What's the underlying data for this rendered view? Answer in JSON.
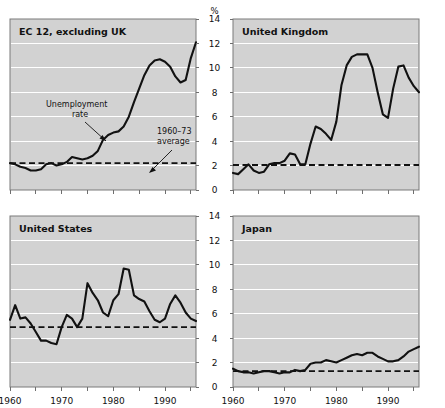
{
  "figure": {
    "unit_label": "%",
    "x_axis": {
      "min": 1960,
      "max": 1996,
      "tick_labels": [
        "1960",
        "1970",
        "1980",
        "1990"
      ],
      "tick_values": [
        1960,
        1970,
        1980,
        1990
      ],
      "minor_tick_values": [
        1965,
        1975,
        1985,
        1995
      ]
    },
    "y_axis": {
      "min": 0,
      "max": 14,
      "tick_labels": [
        "0",
        "2",
        "4",
        "6",
        "8",
        "10",
        "12",
        "14"
      ],
      "tick_values": [
        0,
        2,
        4,
        6,
        8,
        10,
        12,
        14
      ]
    },
    "colors": {
      "plot_background": "#d2d2d2",
      "gridline": "#ffffff",
      "series": "#111111",
      "average_line": "#111111",
      "axis": "#6e6e6e",
      "page_background": "#ffffff"
    }
  },
  "annotations": {
    "unemployment_rate": {
      "line1": "Unemployment",
      "line2": "rate"
    },
    "average_1960_73": {
      "line1": "1960–73",
      "line2": "average"
    }
  },
  "chart_data": [
    {
      "type": "line",
      "title": "EC 12, excluding UK",
      "panel": "top-left",
      "xlabel": "",
      "ylabel": "%",
      "xlim": [
        1960,
        1996
      ],
      "ylim": [
        0,
        14
      ],
      "grid": true,
      "legend": "none",
      "average_1960_73": 2.2,
      "x": [
        1960,
        1961,
        1962,
        1963,
        1964,
        1965,
        1966,
        1967,
        1968,
        1969,
        1970,
        1971,
        1972,
        1973,
        1974,
        1975,
        1976,
        1977,
        1978,
        1979,
        1980,
        1981,
        1982,
        1983,
        1984,
        1985,
        1986,
        1987,
        1988,
        1989,
        1990,
        1991,
        1992,
        1993,
        1994,
        1995,
        1996
      ],
      "values": [
        2.2,
        2.1,
        1.9,
        1.8,
        1.6,
        1.6,
        1.7,
        2.1,
        2.2,
        2.0,
        2.1,
        2.3,
        2.7,
        2.6,
        2.5,
        2.6,
        2.8,
        3.2,
        4.1,
        4.5,
        4.7,
        4.8,
        5.2,
        6.0,
        7.2,
        8.3,
        9.4,
        10.2,
        10.6,
        10.7,
        10.5,
        10.1,
        9.3,
        8.8,
        9.0,
        10.8,
        12.1,
        12.3,
        12.1,
        12.5,
        12.6
      ]
    },
    {
      "type": "line",
      "title": "United Kingdom",
      "panel": "top-right",
      "xlabel": "",
      "ylabel": "%",
      "xlim": [
        1960,
        1996
      ],
      "ylim": [
        0,
        14
      ],
      "grid": true,
      "legend": "none",
      "average_1960_73": 2.05,
      "x": [
        1960,
        1961,
        1962,
        1963,
        1964,
        1965,
        1966,
        1967,
        1968,
        1969,
        1970,
        1971,
        1972,
        1973,
        1974,
        1975,
        1976,
        1977,
        1978,
        1979,
        1980,
        1981,
        1982,
        1983,
        1984,
        1985,
        1986,
        1987,
        1988,
        1989,
        1990,
        1991,
        1992,
        1993,
        1994,
        1995,
        1996
      ],
      "values": [
        1.4,
        1.3,
        1.7,
        2.1,
        1.6,
        1.4,
        1.5,
        2.1,
        2.2,
        2.2,
        2.4,
        3.0,
        2.9,
        2.1,
        2.1,
        3.8,
        5.2,
        5.0,
        4.6,
        4.1,
        5.6,
        8.6,
        10.2,
        10.9,
        11.1,
        11.1,
        11.1,
        10.0,
        8.0,
        6.2,
        5.9,
        8.3,
        10.1,
        10.2,
        9.2,
        8.5,
        8.0
      ]
    },
    {
      "type": "line",
      "title": "United States",
      "panel": "bottom-left",
      "xlabel": "",
      "ylabel": "%",
      "xlim": [
        1960,
        1996
      ],
      "ylim": [
        0,
        14
      ],
      "grid": true,
      "legend": "none",
      "average_1960_73": 4.9,
      "x": [
        1960,
        1961,
        1962,
        1963,
        1964,
        1965,
        1966,
        1967,
        1968,
        1969,
        1970,
        1971,
        1972,
        1973,
        1974,
        1975,
        1976,
        1977,
        1978,
        1979,
        1980,
        1981,
        1982,
        1983,
        1984,
        1985,
        1986,
        1987,
        1988,
        1989,
        1990,
        1991,
        1992,
        1993,
        1994,
        1995,
        1996
      ],
      "values": [
        5.5,
        6.7,
        5.6,
        5.7,
        5.2,
        4.5,
        3.8,
        3.8,
        3.6,
        3.5,
        4.9,
        5.9,
        5.6,
        4.9,
        5.6,
        8.5,
        7.7,
        7.1,
        6.1,
        5.8,
        7.1,
        7.6,
        9.7,
        9.6,
        7.5,
        7.2,
        7.0,
        6.2,
        5.5,
        5.3,
        5.6,
        6.8,
        7.5,
        6.9,
        6.1,
        5.6,
        5.4
      ]
    },
    {
      "type": "line",
      "title": "Japan",
      "panel": "bottom-right",
      "xlabel": "",
      "ylabel": "%",
      "xlim": [
        1960,
        1996
      ],
      "ylim": [
        0,
        14
      ],
      "grid": true,
      "legend": "none",
      "average_1960_73": 1.3,
      "x": [
        1960,
        1961,
        1962,
        1963,
        1964,
        1965,
        1966,
        1967,
        1968,
        1969,
        1970,
        1971,
        1972,
        1973,
        1974,
        1975,
        1976,
        1977,
        1978,
        1979,
        1980,
        1981,
        1982,
        1983,
        1984,
        1985,
        1986,
        1987,
        1988,
        1989,
        1990,
        1991,
        1992,
        1993,
        1994,
        1995,
        1996
      ],
      "values": [
        1.5,
        1.3,
        1.2,
        1.2,
        1.1,
        1.2,
        1.3,
        1.3,
        1.2,
        1.1,
        1.2,
        1.2,
        1.4,
        1.3,
        1.4,
        1.9,
        2.0,
        2.0,
        2.2,
        2.1,
        2.0,
        2.2,
        2.4,
        2.6,
        2.7,
        2.6,
        2.8,
        2.8,
        2.5,
        2.3,
        2.1,
        2.1,
        2.2,
        2.5,
        2.9,
        3.1,
        3.3
      ]
    }
  ]
}
